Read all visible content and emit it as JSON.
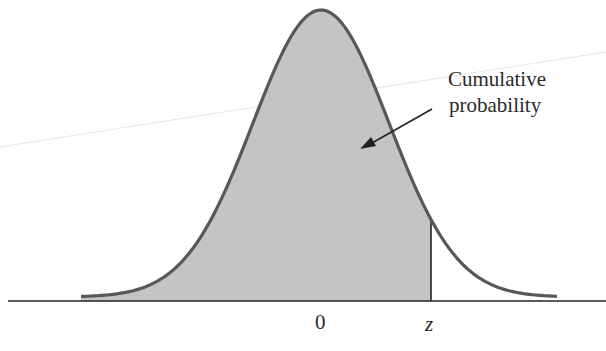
{
  "diagram": {
    "type": "standard-normal-density",
    "annotation": {
      "line1": "Cumulative",
      "line2": "probability"
    },
    "axis_labels": {
      "mean": "0",
      "z": "z"
    },
    "shaded_region": "area under curve to the left of z",
    "colors": {
      "fill": "#c4c4c4",
      "curve": "#585858",
      "axis": "#222222",
      "text": "#2a2a2a"
    }
  }
}
